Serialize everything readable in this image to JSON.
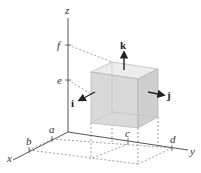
{
  "figure": {
    "axes": {
      "x": "x",
      "y": "y",
      "z": "z"
    },
    "z_ticks": [
      "f",
      "e"
    ],
    "x_ticks": [
      "a",
      "b"
    ],
    "y_ticks": [
      "c",
      "d"
    ],
    "unit_vectors": {
      "i": "i",
      "j": "j",
      "k": "k"
    },
    "colors": {
      "box_face": "#d9d9d9",
      "box_top": "#ececec",
      "box_side": "#cfcfcf",
      "axis": "#555555",
      "dashed": "#777777"
    }
  }
}
